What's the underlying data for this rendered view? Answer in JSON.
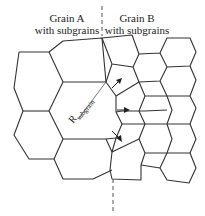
{
  "labels": {
    "grain_a": [
      "Grain A",
      "with subgrains"
    ],
    "grain_b": [
      "Grain B",
      "with subgrains"
    ],
    "radius_symbol": "R",
    "radius_subscript": "subgrain"
  },
  "colors": {
    "line": "#333333",
    "dash": "#555555",
    "background": "#ffffff"
  }
}
